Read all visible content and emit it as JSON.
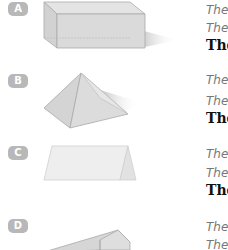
{
  "items": [
    {
      "badge": "A",
      "shape": "rectangular-prism",
      "line1": "The",
      "line2": "The",
      "line3": "The"
    },
    {
      "badge": "B",
      "shape": "square-pyramid",
      "line1": "The",
      "line2": "The",
      "line3": "The"
    },
    {
      "badge": "C",
      "shape": "triangular-prism",
      "line1": "The",
      "line2": "The",
      "line3": "The"
    },
    {
      "badge": "D",
      "shape": "wedge",
      "line1": "The",
      "line2": "The"
    }
  ],
  "colors": {
    "badge_bg": "#b8b8b8",
    "shape_fill": "#d9d9d9",
    "shape_edge": "#a8a8a8"
  }
}
